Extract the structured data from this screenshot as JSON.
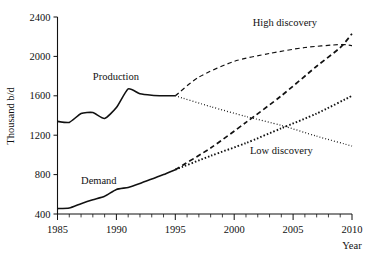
{
  "chart_data": {
    "type": "line",
    "title": "",
    "xlabel": "Year",
    "ylabel": "Thousand b/d",
    "xlim": [
      1985,
      2010
    ],
    "ylim": [
      400,
      2400
    ],
    "ytick_labels": [
      "400",
      "800",
      "1200",
      "1600",
      "2000",
      "2400"
    ],
    "ytick_values": [
      400,
      800,
      1200,
      1600,
      2000,
      2400
    ],
    "xtick_labels": [
      "1985",
      "1990",
      "1995",
      "2000",
      "2005",
      "2010"
    ],
    "xtick_values": [
      1985,
      1990,
      1995,
      2000,
      2005,
      2010
    ],
    "minor_x_ticks_every": 1,
    "grid": false,
    "legend_position": "inline-annotations",
    "annotations": [
      {
        "name": "production",
        "text": "Production",
        "x": 1988.0,
        "y": 1760
      },
      {
        "name": "demand",
        "text": "Demand",
        "x": 1987.0,
        "y": 700
      },
      {
        "name": "high-discovery",
        "text": "High discovery",
        "x": 2004.3,
        "y": 2310
      },
      {
        "name": "low-discovery",
        "text": "Low discovery",
        "x": 2004.0,
        "y": 1010
      }
    ],
    "series": [
      {
        "name": "Production (historical)",
        "style": "solid",
        "x": [
          1985,
          1986,
          1987,
          1988,
          1989,
          1990,
          1991,
          1992,
          1993,
          1994,
          1995
        ],
        "values": [
          1340,
          1330,
          1420,
          1430,
          1370,
          1480,
          1670,
          1620,
          1605,
          1600,
          1600
        ]
      },
      {
        "name": "Production high discovery (projection)",
        "style": "dashed-thin",
        "x": [
          1995,
          1997,
          2000,
          2003,
          2006,
          2009,
          2010
        ],
        "values": [
          1600,
          1790,
          1950,
          2030,
          2090,
          2120,
          2110
        ]
      },
      {
        "name": "Production low discovery (projection)",
        "style": "dash-dot",
        "x": [
          1995,
          1998,
          2001,
          2004,
          2007,
          2010
        ],
        "values": [
          1600,
          1490,
          1390,
          1300,
          1190,
          1090
        ]
      },
      {
        "name": "Demand (historical)",
        "style": "solid",
        "x": [
          1985,
          1986,
          1987,
          1988,
          1989,
          1990,
          1991,
          1992,
          1993,
          1994,
          1995
        ],
        "values": [
          455,
          460,
          505,
          545,
          580,
          650,
          670,
          710,
          755,
          800,
          850
        ]
      },
      {
        "name": "Demand high growth (projection)",
        "style": "dashed",
        "x": [
          1995,
          1998,
          2001,
          2004,
          2007,
          2009,
          2010
        ],
        "values": [
          850,
          1070,
          1330,
          1600,
          1900,
          2090,
          2230
        ]
      },
      {
        "name": "Demand low growth (projection)",
        "style": "dash-dot-heavy",
        "x": [
          1995,
          1998,
          2001,
          2004,
          2007,
          2010
        ],
        "values": [
          850,
          990,
          1120,
          1270,
          1420,
          1600
        ]
      }
    ]
  }
}
